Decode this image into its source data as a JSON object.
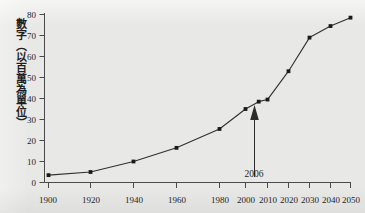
{
  "figure": {
    "background_color": "#e8e8e6",
    "line_color": "#303030",
    "marker_color": "#1a1a1a",
    "axis_color": "#4a4a4a"
  },
  "axes": {
    "y_title": "數字（以百萬為單位）",
    "y_ticks": [
      "0",
      "10",
      "20",
      "30",
      "40",
      "50",
      "60",
      "70",
      "80"
    ],
    "x_ticks": [
      "1900",
      "1920",
      "1940",
      "1960",
      "1980",
      "2000",
      "2010",
      "2020",
      "2030",
      "2040",
      "2050"
    ]
  },
  "annotation": {
    "label": "2006",
    "icon": "up-arrow-icon"
  },
  "chart_data": {
    "type": "line",
    "title": "",
    "xlabel": "",
    "ylabel": "數字（以百萬為單位）",
    "ylim": [
      0,
      80
    ],
    "ytick_step": 10,
    "grid": false,
    "legend": "none",
    "x_axis_note": "non-linear spacing: 20-year steps from 1900 to 2000, then 10-year steps to 2050",
    "x": [
      1900,
      1920,
      1940,
      1960,
      1980,
      2000,
      2006,
      2010,
      2020,
      2030,
      2040,
      2050
    ],
    "values": [
      3.5,
      5.0,
      10.0,
      16.5,
      25.5,
      35.0,
      38.5,
      39.5,
      53.0,
      69.0,
      74.5,
      78.5
    ],
    "series": [
      {
        "name": "數字（以百萬為單位）",
        "values": [
          3.5,
          5.0,
          10.0,
          16.5,
          25.5,
          35.0,
          38.5,
          39.5,
          53.0,
          69.0,
          74.5,
          78.5
        ]
      }
    ],
    "annotations": [
      {
        "text": "2006",
        "x": 2006,
        "y": 38.5,
        "type": "arrow-callout"
      }
    ]
  }
}
